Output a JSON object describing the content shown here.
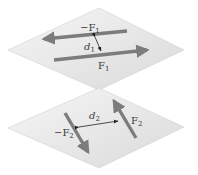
{
  "diagram": {
    "colors": {
      "plane_fill_light": "#f4f4f4",
      "plane_fill_dark": "#dcdcdc",
      "plane_edge": "#cfcfcf",
      "arrow": "#7c7c7c",
      "dimension_line": "#222222",
      "label": "#3a3a3a"
    },
    "planes": [
      {
        "id": "plane-1",
        "forces": [
          {
            "label_sign": "−",
            "label_base": "F",
            "label_sub": "1",
            "direction": "left"
          },
          {
            "label_sign": "",
            "label_base": "F",
            "label_sub": "1",
            "direction": "right"
          }
        ],
        "distance": {
          "label_base": "d",
          "label_sub": "1"
        }
      },
      {
        "id": "plane-2",
        "forces": [
          {
            "label_sign": "−",
            "label_base": "F",
            "label_sub": "2",
            "direction": "down-right"
          },
          {
            "label_sign": "",
            "label_base": "F",
            "label_sub": "2",
            "direction": "up-left"
          }
        ],
        "distance": {
          "label_base": "d",
          "label_sub": "2"
        }
      }
    ]
  }
}
